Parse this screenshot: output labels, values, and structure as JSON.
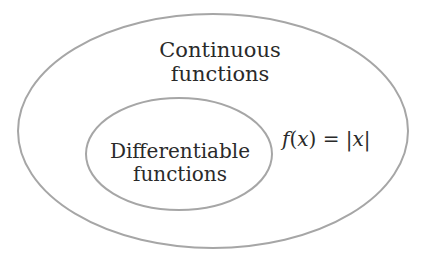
{
  "diagram": {
    "type": "venn-nested-sets",
    "stroke_color": "#a6a6a6",
    "outer_set": {
      "label_line1": "Continuous",
      "label_line2": "functions"
    },
    "inner_set": {
      "label_line1": "Differentiable",
      "label_line2": "functions"
    },
    "example": {
      "f": "f",
      "lparen": "(",
      "x": "x",
      "rparen": ")",
      "eq": " = ",
      "bar": "|",
      "x2": "x"
    }
  }
}
